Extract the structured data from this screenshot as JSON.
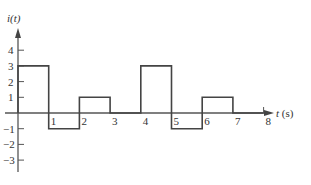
{
  "chart_data": {
    "type": "line",
    "subtype": "step",
    "title": "",
    "xlabel": "t (s)",
    "ylabel": "i(t)",
    "x_ticks": [
      1,
      2,
      3,
      4,
      5,
      6,
      7,
      8
    ],
    "y_ticks": [
      4,
      3,
      2,
      1,
      -1,
      -2,
      -3
    ],
    "xlim": [
      0,
      8.6
    ],
    "ylim": [
      -3.8,
      4.9
    ],
    "grid": false,
    "legend": null,
    "series": [
      {
        "name": "i(t)",
        "segments": [
          {
            "t_start": 0,
            "t_end": 1,
            "value": 3
          },
          {
            "t_start": 1,
            "t_end": 2,
            "value": -1
          },
          {
            "t_start": 2,
            "t_end": 3,
            "value": 1
          },
          {
            "t_start": 3,
            "t_end": 4,
            "value": 0
          },
          {
            "t_start": 4,
            "t_end": 5,
            "value": 3
          },
          {
            "t_start": 5,
            "t_end": 6,
            "value": -1
          },
          {
            "t_start": 6,
            "t_end": 7,
            "value": 1
          },
          {
            "t_start": 7,
            "t_end": 8,
            "value": 0
          }
        ]
      }
    ]
  },
  "labels": {
    "y_axis": "i(t)",
    "x_axis": "t (s)"
  }
}
